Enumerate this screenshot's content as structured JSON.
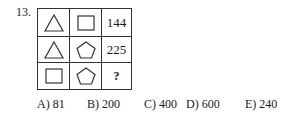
{
  "question": {
    "number": "13.",
    "grid": [
      [
        {
          "type": "shape",
          "shape": "triangle"
        },
        {
          "type": "shape",
          "shape": "square"
        },
        {
          "type": "text",
          "value": "144"
        }
      ],
      [
        {
          "type": "shape",
          "shape": "triangle"
        },
        {
          "type": "shape",
          "shape": "pentagon"
        },
        {
          "type": "text",
          "value": "225"
        }
      ],
      [
        {
          "type": "shape",
          "shape": "square"
        },
        {
          "type": "shape",
          "shape": "pentagon"
        },
        {
          "type": "text",
          "value": "?"
        }
      ]
    ],
    "answers": [
      {
        "label": "A) 81"
      },
      {
        "label": "B) 200"
      },
      {
        "label": "C) 400"
      },
      {
        "label": "D) 600"
      },
      {
        "label": "E) 240"
      }
    ]
  }
}
